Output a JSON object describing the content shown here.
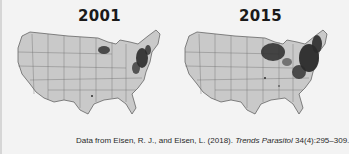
{
  "figure": {
    "panels": [
      {
        "year": "2001",
        "region_label": "United States"
      },
      {
        "year": "2015",
        "region_label": "United States"
      }
    ],
    "caption": {
      "prefix": "Data from Eisen, R. J., and Eisen, L. (2018). ",
      "journal": "Trends Parasitol",
      "suffix": " 34(4):295–309."
    },
    "colors": {
      "background": "#f3f3f3",
      "land": "#c9c9c9",
      "border": "#555555",
      "shading": "#2b2b2b"
    }
  }
}
